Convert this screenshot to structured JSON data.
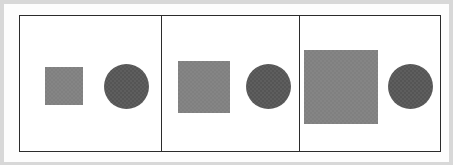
{
  "figure": {
    "canvas": {
      "width": 453,
      "height": 165,
      "background_color": "#d8d8d8",
      "mat_color": "#fdfdfd"
    },
    "frame": {
      "border_color": "#2b2b2b",
      "border_width": 1,
      "fill_color": "#ffffff",
      "left": 15,
      "top": 11,
      "width": 422,
      "height": 137
    },
    "divider": {
      "color": "#2b2b2b",
      "width": 1,
      "count": 2
    }
  },
  "chart_data": {
    "type": "diagram",
    "panel_count": 3,
    "square_color": "#808080",
    "circle_color": "#555555",
    "series": [
      {
        "name": "square_size_px",
        "values": [
          38,
          52,
          74
        ]
      },
      {
        "name": "circle_size_px",
        "values": [
          45,
          45,
          45
        ]
      }
    ],
    "categories": [
      "Panel 1",
      "Panel 2",
      "Panel 3"
    ]
  },
  "panels": [
    {
      "id": "panel-1",
      "label": "Panel 1",
      "left": 0,
      "width": 141,
      "square": {
        "shape": "square",
        "label": "Small square",
        "color": "#808080",
        "size": 38,
        "left": 25,
        "top": 51
      },
      "circle": {
        "shape": "circle",
        "label": "Circle",
        "color": "#555555",
        "size": 45,
        "left": 84,
        "top": 48
      }
    },
    {
      "id": "panel-2",
      "label": "Panel 2",
      "left": 142,
      "width": 138,
      "square": {
        "shape": "square",
        "label": "Medium square",
        "color": "#808080",
        "size": 52,
        "left": 16,
        "top": 45
      },
      "circle": {
        "shape": "circle",
        "label": "Circle",
        "color": "#555555",
        "size": 45,
        "left": 84,
        "top": 48
      }
    },
    {
      "id": "panel-3",
      "label": "Panel 3",
      "left": 281,
      "width": 139,
      "square": {
        "shape": "square",
        "label": "Large square",
        "color": "#808080",
        "size": 74,
        "left": 4,
        "top": 34
      },
      "circle": {
        "shape": "circle",
        "label": "Circle",
        "color": "#555555",
        "size": 45,
        "left": 88,
        "top": 48
      }
    }
  ]
}
